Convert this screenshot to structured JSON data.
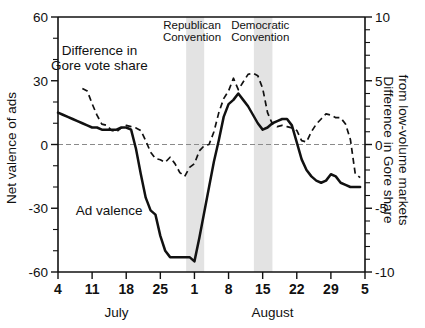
{
  "chart_data": {
    "type": "line",
    "title": "",
    "xlabel": "",
    "ylabel": "Net valence of ads",
    "y2label": "Difference in Gore share from low-volume markets",
    "ylim": [
      -60,
      60
    ],
    "y2lim": [
      -10,
      10
    ],
    "yticks": [
      60,
      30,
      0,
      -30,
      -60
    ],
    "yticklabels": [
      "60",
      "30",
      "0",
      "-30",
      "-60"
    ],
    "y2ticks": [
      10,
      5,
      0,
      -5,
      -10
    ],
    "y2ticklabels": [
      "10",
      "5",
      "0",
      "-5",
      "-10"
    ],
    "yminorstep": 10,
    "xticks": [
      4,
      11,
      18,
      25,
      32,
      39,
      46,
      53,
      60,
      67
    ],
    "xticklabels": [
      "4",
      "11",
      "18",
      "25",
      "1",
      "8",
      "15",
      "22",
      "29",
      "5"
    ],
    "xlim": [
      4,
      67
    ],
    "grid": false,
    "legend_position": "inline-annotations",
    "month_labels": [
      {
        "label": "July",
        "x": 16
      },
      {
        "label": "August",
        "x": 48
      }
    ],
    "annotations": [
      {
        "label": "Republican Convention",
        "line1": "Republican",
        "line2": "Convention",
        "x": 31.5
      },
      {
        "label": "Democratic Convention",
        "line1": "Democratic",
        "line2": "Convention",
        "x": 45.5
      },
      {
        "label": "Difference in Gore vote share",
        "line1": "Difference in",
        "line2": "Gore vote share",
        "x": 12.5,
        "y": 42
      },
      {
        "label": "Ad valence",
        "line1": "Ad valence",
        "x": 14.5,
        "y": -33
      }
    ],
    "shaded_bands": [
      {
        "name": "Republican Convention",
        "x0": 30.3,
        "x1": 34.0,
        "color": "#b9b9b9"
      },
      {
        "name": "Democratic Convention",
        "x0": 44.2,
        "x1": 48.0,
        "color": "#b9b9b9"
      }
    ],
    "series": [
      {
        "name": "Ad valence",
        "style": "solid",
        "axis": "left",
        "x": [
          4,
          5,
          6,
          7,
          8,
          9,
          10,
          11,
          12,
          13,
          14,
          15,
          16,
          17,
          18,
          19,
          20,
          21,
          22,
          23,
          24,
          25,
          26,
          27,
          28,
          29,
          30,
          31,
          32,
          33,
          34,
          35,
          36,
          37,
          38,
          39,
          40,
          41,
          42,
          43,
          44,
          45,
          46,
          47,
          48,
          49,
          50,
          51,
          52,
          53,
          54,
          55,
          56,
          57,
          58,
          59,
          60,
          61,
          62,
          63,
          64,
          65,
          66
        ],
        "values": [
          15,
          14,
          13,
          12,
          11,
          10,
          9,
          8,
          8,
          7,
          7,
          7,
          7,
          8,
          8,
          7,
          -2,
          -14,
          -25,
          -31,
          -33,
          -43,
          -50,
          -53,
          -53,
          -53,
          -53,
          -53,
          -55,
          -44,
          -32,
          -20,
          -8,
          2,
          13,
          19,
          21,
          24,
          21,
          18,
          14,
          10,
          7,
          8,
          10,
          11,
          12,
          12,
          9,
          1,
          -7,
          -12,
          -15,
          -17,
          -18,
          -17,
          -14,
          -15,
          -18,
          -19,
          -20,
          -20,
          -20
        ]
      },
      {
        "name": "Difference in Gore vote share",
        "style": "dashed",
        "axis": "right",
        "x": [
          9,
          10,
          11,
          12,
          13,
          14,
          15,
          16,
          17,
          18,
          19,
          20,
          21,
          22,
          23,
          24,
          25,
          26,
          27,
          28,
          29,
          30,
          31,
          32,
          33,
          34,
          35,
          36,
          37,
          38,
          39,
          40,
          41,
          42,
          43,
          44,
          45,
          46,
          47,
          48,
          49,
          50,
          51,
          52,
          53,
          54,
          55,
          56,
          57,
          58,
          59,
          60,
          61,
          62,
          63,
          64,
          65,
          66
        ],
        "values": [
          4.4,
          4.2,
          3.2,
          2.3,
          1.6,
          1.5,
          1.1,
          1.0,
          1.3,
          1.5,
          1.4,
          1.3,
          1.1,
          0.3,
          -0.6,
          -1.1,
          -1.2,
          -1.4,
          -1.0,
          -1.5,
          -2.2,
          -2.5,
          -1.8,
          -1.5,
          -0.5,
          -0.1,
          0.0,
          1.0,
          2.5,
          3.6,
          4.2,
          5.2,
          4.3,
          4.9,
          5.5,
          5.6,
          5.4,
          4.4,
          2.5,
          1.6,
          1.4,
          1.5,
          1.4,
          1.3,
          1.1,
          0.3,
          0.2,
          1.0,
          1.6,
          2.0,
          2.4,
          2.3,
          2.1,
          2.1,
          1.6,
          0.4,
          -2.3,
          -2.6
        ]
      }
    ]
  },
  "axes": {
    "left_title": "Net valence of ads",
    "right_title_line1": "Difference in Gore share",
    "right_title_line2": "from low-volume markets"
  }
}
